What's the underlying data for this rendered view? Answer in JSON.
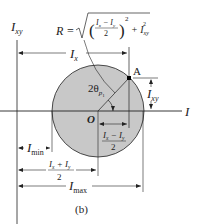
{
  "figure": {
    "caption": "(b)",
    "colors": {
      "circle_fill": "#c8c8c8",
      "stroke": "#222222",
      "background": "#ffffff"
    },
    "axes": {
      "vertical_label_main": "I",
      "vertical_label_sub": "xy",
      "horizontal_label": "I"
    },
    "formula": {
      "lhs": "R =",
      "num": "I",
      "num_sub1": "x",
      "minus": " − I",
      "num_sub2": "y",
      "den": "2",
      "exp": "2",
      "plus": "+ I",
      "plus_sub": "xy",
      "plus_exp": "2"
    },
    "labels": {
      "point_a": "A",
      "origin": "O",
      "angle_main": "2θ",
      "angle_sub": "p",
      "angle_subsub": "1",
      "ix_main": "I",
      "ix_sub": "x",
      "ixy_main": "I",
      "ixy_sub": "xy",
      "diff_num": "I",
      "diff_sub1": "x",
      "diff_minus": " − I",
      "diff_sub2": "y",
      "diff_den": "2",
      "imin_main": "I",
      "imin_sub": "min",
      "sum_num": "I",
      "sum_sub1": "x",
      "sum_plus": " + I",
      "sum_sub2": "y",
      "sum_den": "2",
      "imax_main": "I",
      "imax_sub": "max"
    }
  }
}
